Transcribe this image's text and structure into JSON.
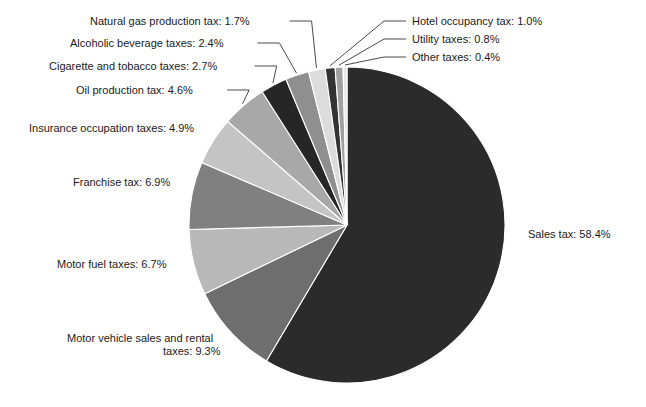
{
  "chart_data": {
    "type": "pie",
    "title": "",
    "subtitle": "",
    "xlabel": "",
    "ylabel": "",
    "legend_position": "none",
    "grid": false,
    "units": "percent",
    "start_angle_deg": -90,
    "direction": "clockwise",
    "categories": [
      "Sales tax",
      "Motor vehicle sales and rental taxes",
      "Motor fuel taxes",
      "Franchise tax",
      "Insurance occupation taxes",
      "Oil production tax",
      "Cigarette and tobacco taxes",
      "Alcoholic beverage taxes",
      "Natural gas production tax",
      "Hotel occupancy tax",
      "Utility taxes",
      "Other taxes"
    ],
    "values": [
      58.4,
      9.3,
      6.7,
      6.9,
      4.9,
      4.6,
      2.7,
      2.4,
      1.7,
      1.0,
      0.8,
      0.4
    ],
    "colors": [
      "#2b2b2b",
      "#6e6e6e",
      "#b8b8b8",
      "#808080",
      "#c4c4c4",
      "#a8a8a8",
      "#262626",
      "#8f8f8f",
      "#dcdcdc",
      "#333333",
      "#a0a0a0",
      "#e8e8e8"
    ],
    "slices": [
      {
        "name": "Sales tax",
        "value": 58.4,
        "label": "Sales tax: 58.4%",
        "color": "#2b2b2b",
        "label_x": 528,
        "label_y": 238,
        "anchor": "start",
        "has_leader": false
      },
      {
        "name": "Motor vehicle sales and rental taxes",
        "value": 9.3,
        "label": "Motor vehicle sales and rental",
        "label_line2": "taxes: 9.3%",
        "color": "#6e6e6e",
        "label_x": 67,
        "label_y": 342,
        "anchor": "start",
        "has_leader": false
      },
      {
        "name": "Motor fuel taxes",
        "value": 6.7,
        "label": "Motor fuel taxes: 6.7%",
        "color": "#b8b8b8",
        "label_x": 57,
        "label_y": 268,
        "anchor": "start",
        "has_leader": false
      },
      {
        "name": "Franchise tax",
        "value": 6.9,
        "label": "Franchise tax: 6.9%",
        "color": "#808080",
        "label_x": 73,
        "label_y": 186,
        "anchor": "start",
        "has_leader": false
      },
      {
        "name": "Insurance occupation taxes",
        "value": 4.9,
        "label": "Insurance occupation taxes: 4.9%",
        "color": "#c4c4c4",
        "label_x": 29,
        "label_y": 132,
        "anchor": "start",
        "has_leader": false
      },
      {
        "name": "Oil production tax",
        "value": 4.6,
        "label": "Oil production tax: 4.6%",
        "color": "#a8a8a8",
        "label_x": 76,
        "label_y": 94,
        "anchor": "start",
        "has_leader": true
      },
      {
        "name": "Cigarette and tobacco taxes",
        "value": 2.7,
        "label": "Cigarette and tobacco taxes: 2.7%",
        "color": "#262626",
        "label_x": 49,
        "label_y": 70,
        "anchor": "start",
        "has_leader": true
      },
      {
        "name": "Alcoholic beverage taxes",
        "value": 2.4,
        "label": "Alcoholic beverage taxes: 2.4%",
        "color": "#8f8f8f",
        "label_x": 70,
        "label_y": 47,
        "anchor": "start",
        "has_leader": true
      },
      {
        "name": "Natural gas production tax",
        "value": 1.7,
        "label": "Natural gas production tax: 1.7%",
        "color": "#dcdcdc",
        "label_x": 90,
        "label_y": 25,
        "anchor": "start",
        "has_leader": true
      },
      {
        "name": "Hotel occupancy tax",
        "value": 1.0,
        "label": "Hotel occupancy tax: 1.0%",
        "color": "#333333",
        "label_x": 412,
        "label_y": 25,
        "anchor": "start",
        "has_leader": true
      },
      {
        "name": "Utility taxes",
        "value": 0.8,
        "label": "Utility taxes: 0.8%",
        "color": "#a0a0a0",
        "label_x": 412,
        "label_y": 43,
        "anchor": "start",
        "has_leader": true
      },
      {
        "name": "Other taxes",
        "value": 0.4,
        "label": "Other taxes: 0.4%",
        "color": "#e8e8e8",
        "label_x": 412,
        "label_y": 61,
        "anchor": "start",
        "has_leader": true
      }
    ],
    "geometry": {
      "center_x": 347,
      "center_y": 225,
      "radius": 158
    }
  }
}
